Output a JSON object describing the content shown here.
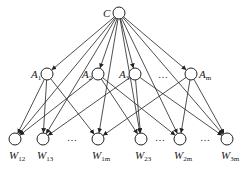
{
  "diagram": {
    "type": "hierarchical network (ANP-style)",
    "root": {
      "id": "C",
      "label": "C",
      "sub": "",
      "x": 119,
      "y": 13
    },
    "middle": [
      {
        "id": "A1",
        "label": "A",
        "sub": "1",
        "x": 47,
        "y": 74,
        "label_side": "left"
      },
      {
        "id": "A2",
        "label": "A",
        "sub": "2",
        "x": 98,
        "y": 74,
        "label_side": "left"
      },
      {
        "id": "A3",
        "label": "A",
        "sub": "3",
        "x": 135,
        "y": 74,
        "label_side": "left"
      },
      {
        "id": "Am",
        "label": "A",
        "sub": "m",
        "x": 191,
        "y": 74,
        "label_side": "right"
      }
    ],
    "middle_ellipsis": {
      "text": "…",
      "x": 163,
      "y": 78
    },
    "bottom": [
      {
        "id": "W12",
        "label": "W",
        "sub": "12",
        "x": 15,
        "y": 139
      },
      {
        "id": "W13",
        "label": "W",
        "sub": "13",
        "x": 43,
        "y": 139
      },
      {
        "id": "W1m",
        "label": "W",
        "sub": "1m",
        "x": 98,
        "y": 139
      },
      {
        "id": "W23",
        "label": "W",
        "sub": "23",
        "x": 141,
        "y": 139
      },
      {
        "id": "W2m",
        "label": "W",
        "sub": "2m",
        "x": 180,
        "y": 139
      },
      {
        "id": "W3m",
        "label": "W",
        "sub": "3m",
        "x": 227,
        "y": 139
      }
    ],
    "bottom_ellipses": [
      {
        "text": "…",
        "x": 72,
        "y": 141
      },
      {
        "text": "…",
        "x": 160,
        "y": 141
      },
      {
        "text": "…",
        "x": 205,
        "y": 141
      }
    ],
    "edges": [
      [
        "C",
        "A1"
      ],
      [
        "C",
        "A2"
      ],
      [
        "C",
        "A3"
      ],
      [
        "C",
        "Am"
      ],
      [
        "C",
        "W12"
      ],
      [
        "C",
        "W13"
      ],
      [
        "C",
        "W1m"
      ],
      [
        "C",
        "W23"
      ],
      [
        "C",
        "W2m"
      ],
      [
        "C",
        "W3m"
      ],
      [
        "A1",
        "W12"
      ],
      [
        "A1",
        "W13"
      ],
      [
        "A1",
        "W1m"
      ],
      [
        "A2",
        "W12"
      ],
      [
        "A2",
        "W23"
      ],
      [
        "A2",
        "W2m"
      ],
      [
        "A3",
        "W13"
      ],
      [
        "A3",
        "W23"
      ],
      [
        "A3",
        "W3m"
      ],
      [
        "Am",
        "W1m"
      ],
      [
        "Am",
        "W2m"
      ],
      [
        "Am",
        "W3m"
      ]
    ],
    "node_radius": 6,
    "colors": {
      "stroke": "#222222",
      "fill": "#ffffff",
      "background": "#ffffff"
    }
  }
}
